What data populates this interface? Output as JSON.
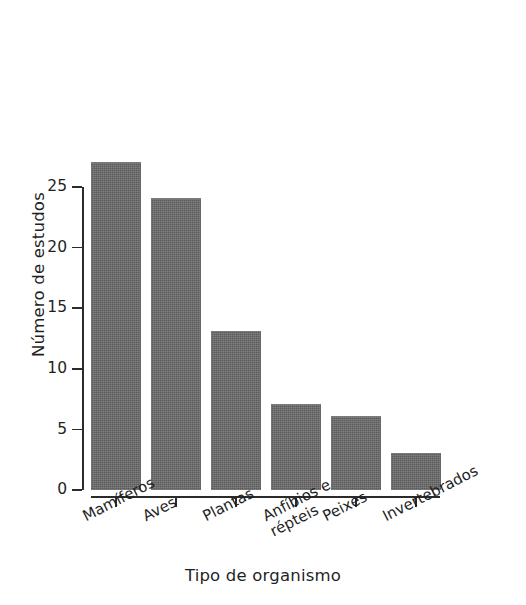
{
  "chart_data": {
    "type": "bar",
    "title": "",
    "subtitle": "",
    "xlabel": "Tipo de organismo",
    "ylabel": "Número de estudos",
    "categories": [
      "Mamíferos",
      "Aves",
      "Plantas",
      "Anfíbios e répteis",
      "Peixes",
      "Invertebrados"
    ],
    "values": [
      27,
      24,
      13,
      7,
      6,
      3
    ],
    "ylim": [
      0,
      25
    ],
    "yticks": [
      0,
      5,
      10,
      15,
      20,
      25
    ],
    "ytick_labels": [
      "0",
      "5",
      "10",
      "15",
      "20",
      "25"
    ],
    "grid": false,
    "legend": false,
    "legend_position": "none",
    "bar_color": "#666666",
    "axis_color": "#2b2b2b",
    "background_color": "#ffffff",
    "xtick_label_rotation": -27
  }
}
